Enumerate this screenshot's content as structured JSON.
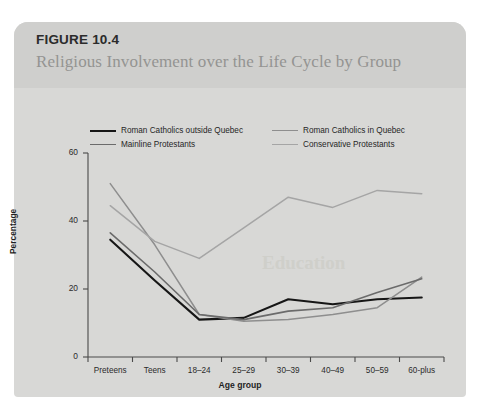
{
  "figure": {
    "number": "FIGURE 10.4",
    "title": "Religious Involvement over the Life Cycle by Group",
    "background_color": "#d8d8d6",
    "header_color": "#cfcfcd"
  },
  "ghost_text": "Education",
  "legend": {
    "entries": [
      {
        "label": "Roman Catholics outside Quebec",
        "color": "#161616",
        "width": 2.1
      },
      {
        "label": "Roman Catholics in Quebec",
        "color": "#8e8e8e",
        "width": 1.5
      },
      {
        "label": "Mainline Protestants",
        "color": "#6b6b6b",
        "width": 1.6
      },
      {
        "label": "Conservative Protestants",
        "color": "#a5a5a5",
        "width": 1.5
      }
    ]
  },
  "chart_data": {
    "type": "line",
    "title": "Religious Involvement over the Life Cycle by Group",
    "xlabel": "Age group",
    "ylabel": "Percentage",
    "categories": [
      "Preteens",
      "Teens",
      "18–24",
      "25–29",
      "30–39",
      "40–49",
      "50–59",
      "60-plus"
    ],
    "ylim": [
      0,
      60
    ],
    "yticks": [
      0,
      20,
      40,
      60
    ],
    "grid": false,
    "legend_position": "above-plot",
    "series": [
      {
        "name": "Roman Catholics outside Quebec",
        "color": "#161616",
        "width": 2.1,
        "values": [
          34.5,
          22.5,
          11.0,
          11.5,
          17.0,
          15.5,
          17.0,
          17.5
        ]
      },
      {
        "name": "Roman Catholics in Quebec",
        "color": "#8e8e8e",
        "width": 1.5,
        "values": [
          51.0,
          33.0,
          12.5,
          10.5,
          11.0,
          12.5,
          14.5,
          23.5
        ]
      },
      {
        "name": "Mainline Protestants",
        "color": "#6b6b6b",
        "width": 1.6,
        "values": [
          36.5,
          25.0,
          12.5,
          11.0,
          13.5,
          14.5,
          19.0,
          23.0
        ]
      },
      {
        "name": "Conservative Protestants",
        "color": "#a5a5a5",
        "width": 1.5,
        "values": [
          44.5,
          34.0,
          29.0,
          38.0,
          47.0,
          44.0,
          49.0,
          48.0
        ]
      }
    ]
  }
}
